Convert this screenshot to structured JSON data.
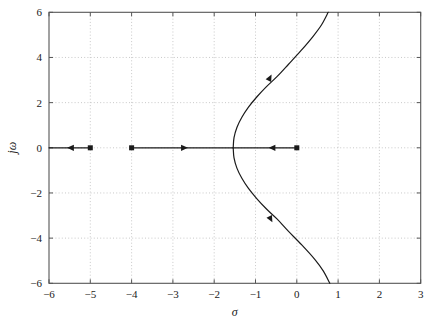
{
  "figure": {
    "kind": "root-locus-plot",
    "background": "#ffffff",
    "frame_color": "#555555",
    "grid_color": "#bbbbbb",
    "locus_color": "#1a1a1a"
  },
  "axes": {
    "x": {
      "label": "σ",
      "min": -6,
      "max": 3,
      "tick_step": 1,
      "ticks": [
        -6,
        -5,
        -4,
        -3,
        -2,
        -1,
        0,
        1,
        2,
        3
      ],
      "tick_labels": [
        "−6",
        "−5",
        "−4",
        "−3",
        "−2",
        "−1",
        "0",
        "1",
        "2",
        "3"
      ]
    },
    "y": {
      "label": "jω",
      "min": -6,
      "max": 6,
      "tick_step": 2,
      "ticks": [
        -6,
        -4,
        -2,
        0,
        2,
        4,
        6
      ],
      "tick_labels": [
        "−6",
        "−4",
        "−2",
        "0",
        "2",
        "4",
        "6"
      ]
    },
    "grid": "on",
    "grid_style": "dotted"
  },
  "chart_data": {
    "type": "line",
    "title": "",
    "xlabel": "σ",
    "ylabel": "jω",
    "xlim": [
      -6,
      3
    ],
    "ylim": [
      -6,
      6
    ],
    "grid": "on",
    "legend": "none",
    "poles": [
      {
        "sigma": 0,
        "omega": 0,
        "marker": "square"
      },
      {
        "sigma": -4,
        "omega": 0,
        "marker": "square"
      },
      {
        "sigma": -5,
        "omega": 0,
        "marker": "square"
      }
    ],
    "zeros": [],
    "breakaway_point": {
      "sigma": -1.54,
      "omega": 0
    },
    "series": [
      {
        "name": "real-axis-branch-from-origin",
        "comment": "segment on real axis from pole at 0 leftward to breakaway point",
        "x": [
          0,
          -1.54
        ],
        "y": [
          0,
          0
        ]
      },
      {
        "name": "real-axis-branch-from-minus-4",
        "comment": "segment on real axis from pole at -4 rightward to breakaway point",
        "x": [
          -4,
          -1.54
        ],
        "y": [
          0,
          0
        ]
      },
      {
        "name": "real-axis-branch-from-minus-5",
        "comment": "segment on real axis from pole at -5 leftward to minus infinity",
        "x": [
          -5,
          -6
        ],
        "y": [
          0,
          0
        ]
      },
      {
        "name": "complex-branch-upper",
        "x": [
          -1.54,
          -1.52,
          -1.45,
          -1.33,
          -1.17,
          -0.97,
          -0.74,
          -0.48,
          -0.2,
          0.1,
          0.4,
          0.6,
          0.76
        ],
        "y": [
          0.0,
          0.45,
          0.9,
          1.35,
          1.8,
          2.25,
          2.7,
          3.15,
          3.7,
          4.3,
          4.95,
          5.45,
          6.0
        ]
      },
      {
        "name": "complex-branch-lower",
        "x": [
          -1.54,
          -1.52,
          -1.45,
          -1.33,
          -1.17,
          -0.97,
          -0.74,
          -0.48,
          -0.2,
          0.12,
          0.44,
          0.64,
          0.8
        ],
        "y": [
          0.0,
          -0.45,
          -0.9,
          -1.35,
          -1.8,
          -2.25,
          -2.7,
          -3.15,
          -3.7,
          -4.3,
          -4.95,
          -5.45,
          -6.0
        ]
      }
    ],
    "direction_arrows": [
      {
        "sigma": -0.62,
        "omega": 0,
        "direction": "left",
        "on": "real-axis"
      },
      {
        "sigma": -2.7,
        "omega": 0,
        "direction": "right",
        "on": "real-axis"
      },
      {
        "sigma": -5.5,
        "omega": 0,
        "direction": "left",
        "on": "real-axis"
      },
      {
        "sigma": -0.64,
        "omega": 3.14,
        "direction": "up-right",
        "on": "complex-branch-upper"
      },
      {
        "sigma": -0.62,
        "omega": -3.2,
        "direction": "down-right",
        "on": "complex-branch-lower"
      }
    ]
  }
}
